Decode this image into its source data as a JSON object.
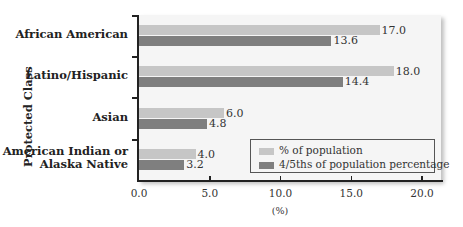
{
  "chart_data": {
    "type": "bar",
    "orientation": "horizontal",
    "title": "",
    "xlabel": "(%)",
    "ylabel": "Protected Class",
    "xlim": [
      0,
      20
    ],
    "xticks": [
      "0.0",
      "5.0",
      "10.0",
      "15.0",
      "20.0"
    ],
    "categories": [
      "African American",
      "Latino/Hispanic",
      "Asian",
      "American Indian or Alaska Native"
    ],
    "category_lines": [
      [
        "African American"
      ],
      [
        "Latino/Hispanic"
      ],
      [
        "Asian"
      ],
      [
        "American Indian or",
        "Alaska Native"
      ]
    ],
    "series": [
      {
        "name": "% of population",
        "color": "#c6c6c6",
        "values": [
          17.0,
          18.0,
          6.0,
          4.0
        ],
        "labels": [
          "17.0",
          "18.0",
          "6.0",
          "4.0"
        ]
      },
      {
        "name": "4/5ths of population percentage",
        "color": "#7f7f7f",
        "values": [
          13.6,
          14.4,
          4.8,
          3.2
        ],
        "labels": [
          "13.6",
          "14.4",
          "4.8",
          "3.2"
        ]
      }
    ],
    "grid": false,
    "legend_position": "lower right"
  }
}
